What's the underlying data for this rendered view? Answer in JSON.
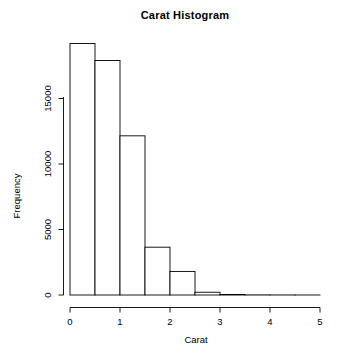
{
  "chart_data": {
    "type": "bar",
    "title": "Carat Histogram",
    "xlabel": "Carat",
    "ylabel": "Frequency",
    "grid": false,
    "legend": "none",
    "bin_width": 0.5,
    "bin_edges": [
      0,
      0.5,
      1.0,
      1.5,
      2.0,
      2.5,
      3.0,
      3.5,
      4.0,
      4.5,
      5.0
    ],
    "categories": [
      "0-0.5",
      "0.5-1",
      "1-1.5",
      "1.5-2",
      "2-2.5",
      "2.5-3",
      "3-3.5",
      "3.5-4",
      "4-4.5",
      "4.5-5"
    ],
    "values": [
      19200,
      17900,
      12150,
      3650,
      1800,
      210,
      40,
      10,
      4,
      1
    ],
    "x": [
      0.25,
      0.75,
      1.25,
      1.75,
      2.25,
      2.75,
      3.25,
      3.75,
      4.25,
      4.75
    ],
    "xlim": [
      0,
      5
    ],
    "ylim": [
      0,
      20000
    ],
    "xticks": [
      0,
      1,
      2,
      3,
      4,
      5
    ],
    "xtick_labels": [
      "0",
      "1",
      "2",
      "3",
      "4",
      "5"
    ],
    "yticks": [
      0,
      5000,
      10000,
      15000
    ],
    "ytick_labels": [
      "0",
      "5000",
      "10000",
      "15000"
    ],
    "bar_fill": "#ffffff",
    "bar_stroke": "#000000",
    "axis_color": "#000000",
    "background": "#ffffff"
  }
}
